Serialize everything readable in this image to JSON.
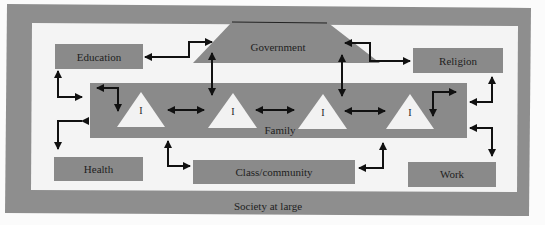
{
  "diagram": {
    "outer_frame": {
      "label": "Society at large"
    },
    "nodes": {
      "government": {
        "label": "Government"
      },
      "education": {
        "label": "Education"
      },
      "religion": {
        "label": "Religion"
      },
      "family": {
        "label": "Family"
      },
      "health": {
        "label": "Health"
      },
      "class_community": {
        "label": "Class/community"
      },
      "work": {
        "label": "Work"
      }
    },
    "individuals": [
      {
        "label": "I"
      },
      {
        "label": "I"
      },
      {
        "label": "I"
      },
      {
        "label": "I"
      }
    ],
    "connections": [
      [
        "Government",
        "Education"
      ],
      [
        "Government",
        "Religion"
      ],
      [
        "Government",
        "Family"
      ],
      [
        "Education",
        "Family"
      ],
      [
        "Religion",
        "Family"
      ],
      [
        "Health",
        "Family"
      ],
      [
        "Class/community",
        "Family"
      ],
      [
        "Work",
        "Family"
      ],
      [
        "I",
        "I"
      ]
    ],
    "colors": {
      "frame_gray": "#8e8e8e",
      "box_gray": "#8a8a8a",
      "background": "#f4f4f4",
      "triangle": "#f2f2f2",
      "arrow": "#111111"
    }
  }
}
